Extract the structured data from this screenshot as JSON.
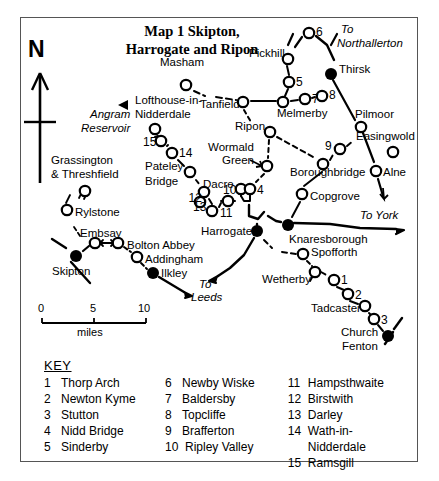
{
  "title": {
    "line1": "Map 1  Skipton,",
    "line2": "Harrogate and Ripon"
  },
  "compass": {
    "label": "N",
    "icon": "north-arrow-icon"
  },
  "scale": {
    "ticks": [
      "0",
      "5",
      "10"
    ],
    "unit": "miles"
  },
  "map": {
    "places": [
      {
        "name": "Masham",
        "type": "open",
        "x": 186,
        "y": 85,
        "lx": 182,
        "ly": 63,
        "anchor": "middle"
      },
      {
        "name": "Pickhill",
        "type": "open",
        "x": 288,
        "y": 59,
        "lx": 285,
        "ly": 54,
        "anchor": "end"
      },
      {
        "name": "Thirsk",
        "type": "filled",
        "x": 331,
        "y": 74,
        "lx": 339,
        "ly": 70,
        "anchor": "start"
      },
      {
        "name": "Tanfield",
        "type": "open",
        "x": 243,
        "y": 102,
        "lx": 240,
        "ly": 105,
        "anchor": "end"
      },
      {
        "name": "Melmerby",
        "type": "open",
        "x": 283,
        "y": 102,
        "lx": 277,
        "ly": 114,
        "anchor": "start"
      },
      {
        "name": "Pilmoor",
        "type": "open",
        "x": 361,
        "y": 127,
        "lx": 355,
        "ly": 115,
        "anchor": "start"
      },
      {
        "name": "Ripon",
        "type": "open",
        "x": 270,
        "y": 132,
        "lx": 265,
        "ly": 127,
        "anchor": "end"
      },
      {
        "name": "Easingwold",
        "type": "open",
        "x": 393,
        "y": 152,
        "lx": 356,
        "ly": 137,
        "anchor": "start"
      },
      {
        "name": "Wormald",
        "type": "open",
        "x": 267,
        "y": 166,
        "lx": 254,
        "ly": 148,
        "anchor": "end"
      },
      {
        "name": "Green",
        "type": "none",
        "x": 0,
        "y": 0,
        "lx": 254,
        "ly": 161,
        "anchor": "end"
      },
      {
        "name": "Lofthouse-in-",
        "type": "none",
        "x": 0,
        "y": 0,
        "lx": 135,
        "ly": 101,
        "anchor": "start"
      },
      {
        "name": "Nidderdale",
        "type": "open",
        "x": 155,
        "y": 129,
        "lx": 135,
        "ly": 115,
        "anchor": "start"
      },
      {
        "name": "Angram",
        "type": "none",
        "x": 0,
        "y": 0,
        "lx": 130,
        "ly": 115,
        "anchor": "end"
      },
      {
        "name": "Reservoir",
        "type": "none",
        "x": 0,
        "y": 0,
        "lx": 130,
        "ly": 129,
        "anchor": "end"
      },
      {
        "name": "Grassington",
        "type": "none",
        "x": 0,
        "y": 0,
        "lx": 51,
        "ly": 161,
        "anchor": "start"
      },
      {
        "name": "& Threshfield",
        "type": "open",
        "x": 85,
        "y": 191,
        "lx": 51,
        "ly": 175,
        "anchor": "start"
      },
      {
        "name": "Pateley",
        "type": "none",
        "x": 0,
        "y": 0,
        "lx": 145,
        "ly": 167,
        "anchor": "start"
      },
      {
        "name": "Bridge",
        "type": "open",
        "x": 190,
        "y": 172,
        "lx": 145,
        "ly": 182,
        "anchor": "start"
      },
      {
        "name": "Dacre",
        "type": "open",
        "x": 204,
        "y": 192,
        "lx": 203,
        "ly": 185,
        "anchor": "start"
      },
      {
        "name": "Rylstone",
        "type": "open",
        "x": 67,
        "y": 210,
        "lx": 75,
        "ly": 213,
        "anchor": "start"
      },
      {
        "name": "Embsay",
        "type": "open",
        "x": 95,
        "y": 243,
        "lx": 80,
        "ly": 234,
        "anchor": "start"
      },
      {
        "name": "Bolton  Abbey",
        "type": "open",
        "x": 118,
        "y": 243,
        "lx": 127,
        "ly": 246,
        "anchor": "start"
      },
      {
        "name": "Addingham",
        "type": "open",
        "x": 137,
        "y": 257,
        "lx": 145,
        "ly": 260,
        "anchor": "start"
      },
      {
        "name": "Ilkley",
        "type": "filled",
        "x": 153,
        "y": 273,
        "lx": 161,
        "ly": 274,
        "anchor": "start"
      },
      {
        "name": "Skipton",
        "type": "filled",
        "x": 76,
        "y": 256,
        "lx": 71,
        "ly": 272,
        "anchor": "middle"
      },
      {
        "name": "Harrogate",
        "type": "filled",
        "x": 257,
        "y": 231,
        "lx": 252,
        "ly": 232,
        "anchor": "end"
      },
      {
        "name": "Knaresborough",
        "type": "filled",
        "x": 288,
        "y": 225,
        "lx": 289,
        "ly": 240,
        "anchor": "start"
      },
      {
        "name": "Boroughbridge",
        "type": "open",
        "x": 323,
        "y": 164,
        "lx": 290,
        "ly": 173,
        "anchor": "start"
      },
      {
        "name": "Copgrove",
        "type": "open",
        "x": 302,
        "y": 194,
        "lx": 310,
        "ly": 197,
        "anchor": "start"
      },
      {
        "name": "Alne",
        "type": "open",
        "x": 376,
        "y": 171,
        "lx": 383,
        "ly": 173,
        "anchor": "start"
      },
      {
        "name": "Spofforth",
        "type": "open",
        "x": 303,
        "y": 254,
        "lx": 311,
        "ly": 253,
        "anchor": "start"
      },
      {
        "name": "Wetherby",
        "type": "open",
        "x": 315,
        "y": 272,
        "lx": 311,
        "ly": 280,
        "anchor": "end"
      },
      {
        "name": "Tadcaster",
        "type": "open",
        "x": 365,
        "y": 306,
        "lx": 361,
        "ly": 309,
        "anchor": "end"
      },
      {
        "name": "Church",
        "type": "filled",
        "x": 388,
        "y": 336,
        "lx": 378,
        "ly": 333,
        "anchor": "end"
      },
      {
        "name": "Fenton",
        "type": "none",
        "x": 0,
        "y": 0,
        "lx": 378,
        "ly": 347,
        "anchor": "end"
      }
    ],
    "numbered": [
      {
        "n": "6",
        "x": 309,
        "y": 33,
        "lx": 316,
        "ly": 32,
        "anchor": "start"
      },
      {
        "n": "5",
        "x": 289,
        "y": 82,
        "lx": 296,
        "ly": 82,
        "anchor": "start"
      },
      {
        "n": "7",
        "x": 305,
        "y": 99,
        "lx": 312,
        "ly": 99,
        "anchor": "start"
      },
      {
        "n": "8",
        "x": 322,
        "y": 96,
        "lx": 329,
        "ly": 95,
        "anchor": "start"
      },
      {
        "n": "9",
        "x": 340,
        "y": 149,
        "lx": 332,
        "ly": 146,
        "anchor": "end"
      },
      {
        "n": "15",
        "x": 161,
        "y": 141,
        "lx": 156,
        "ly": 142,
        "anchor": "end"
      },
      {
        "n": "14",
        "x": 172,
        "y": 153,
        "lx": 179,
        "ly": 153,
        "anchor": "start"
      },
      {
        "n": "12",
        "x": 200,
        "y": 202,
        "lx": 195,
        "ly": 198,
        "anchor": "middle"
      },
      {
        "n": "13",
        "x": 212,
        "y": 211,
        "lx": 206,
        "ly": 207,
        "anchor": "end"
      },
      {
        "n": "10",
        "x": 241,
        "y": 189,
        "lx": 236,
        "ly": 190,
        "anchor": "end"
      },
      {
        "n": "4",
        "x": 250,
        "y": 189,
        "lx": 257,
        "ly": 190,
        "anchor": "start"
      },
      {
        "n": "11",
        "x": 228,
        "y": 201,
        "lx": 226,
        "ly": 213,
        "anchor": "middle"
      },
      {
        "n": "1",
        "x": 334,
        "y": 280,
        "lx": 341,
        "ly": 280,
        "anchor": "start"
      },
      {
        "n": "2",
        "x": 348,
        "y": 294,
        "lx": 355,
        "ly": 295,
        "anchor": "start"
      },
      {
        "n": "3",
        "x": 374,
        "y": 319,
        "lx": 381,
        "ly": 320,
        "anchor": "start"
      }
    ],
    "directions": [
      {
        "label1": "To",
        "label2": "Northallerton",
        "lx": 341,
        "ly": 30,
        "l2x": 337,
        "l2y": 44
      },
      {
        "label1": "To  York",
        "label2": "",
        "lx": 360,
        "ly": 216,
        "l2x": 0,
        "l2y": 0
      },
      {
        "label1": "To",
        "label2": "Leeds",
        "lx": 199,
        "ly": 285,
        "l2x": 191,
        "l2y": 298
      }
    ]
  },
  "key": {
    "title": "KEY",
    "columns": [
      [
        {
          "n": "1",
          "name": "Thorp Arch"
        },
        {
          "n": "2",
          "name": "Newton Kyme"
        },
        {
          "n": "3",
          "name": "Stutton"
        },
        {
          "n": "4",
          "name": "Nidd Bridge"
        },
        {
          "n": "5",
          "name": "Sinderby"
        }
      ],
      [
        {
          "n": "6",
          "name": "Newby Wiske"
        },
        {
          "n": "7",
          "name": "Baldersby"
        },
        {
          "n": "8",
          "name": "Topcliffe"
        },
        {
          "n": "9",
          "name": "Brafferton"
        },
        {
          "n": "10",
          "name": "Ripley Valley"
        }
      ],
      [
        {
          "n": "11",
          "name": "Hampsthwaite"
        },
        {
          "n": "12",
          "name": "Birstwith"
        },
        {
          "n": "13",
          "name": "Darley"
        },
        {
          "n": "14",
          "name": "Wath-in-Nidderdale"
        },
        {
          "n": "15",
          "name": "Ramsgill"
        }
      ]
    ]
  },
  "colors": {
    "ink": "#000000",
    "frame": "#555555",
    "paper": "#ffffff"
  }
}
